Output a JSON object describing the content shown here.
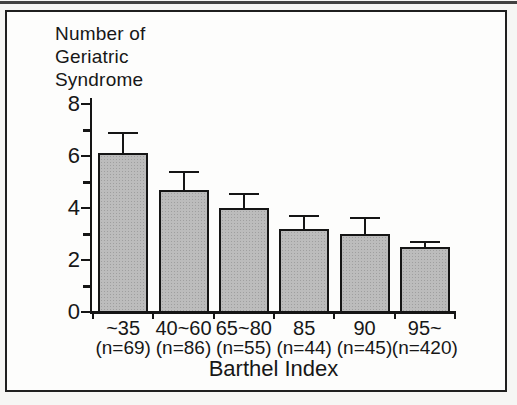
{
  "figure": {
    "ylabel_lines": [
      "Number of",
      "Geriatric",
      "Syndrome"
    ]
  },
  "chart_data": {
    "type": "bar",
    "ylabel": "Number of Geriatric Syndrome",
    "xlabel": "Barthel Index",
    "categories": [
      "~35",
      "40~60",
      "65~80",
      "85",
      "90",
      "95~"
    ],
    "n_labels": [
      "(n=69)",
      "(n=86)",
      "(n=55)",
      "(n=44)",
      "(n=45)",
      "(n=420)"
    ],
    "values": [
      6.1,
      4.7,
      4.0,
      3.2,
      3.0,
      2.5
    ],
    "errors": [
      0.8,
      0.7,
      0.55,
      0.5,
      0.6,
      0.2
    ],
    "ylim": [
      0,
      8
    ],
    "yticks_major": [
      0,
      2,
      4,
      6,
      8
    ],
    "yticks_minor": [
      1,
      3,
      5,
      7
    ],
    "grid": false,
    "legend": "none",
    "bar_color": "#bcbcbc",
    "bar_border_color": "#151515",
    "ink_color": "#171717"
  }
}
